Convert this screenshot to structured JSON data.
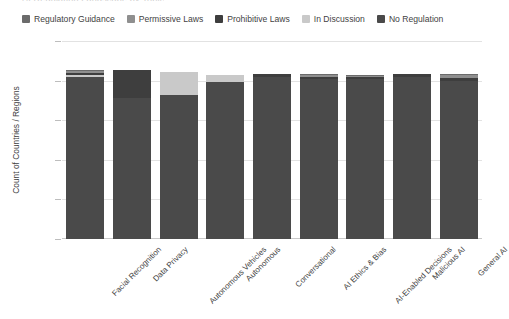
{
  "clipped_title": "AI Regulation Landscape by Topic",
  "legend": {
    "position": "top",
    "items": [
      {
        "label": "Regulatory Guidance",
        "color": "#6b6b6b",
        "icon": "square-swatch"
      },
      {
        "label": "Permissive Laws",
        "color": "#8f8f8f",
        "icon": "square-swatch"
      },
      {
        "label": "Prohibitive Laws",
        "color": "#3e3e3e",
        "icon": "square-swatch"
      },
      {
        "label": "In Discussion",
        "color": "#c9c9c9",
        "icon": "square-swatch"
      },
      {
        "label": "No Regulation",
        "color": "#4a4a4a",
        "icon": "square-swatch"
      }
    ]
  },
  "axes": {
    "ylabel": "Count of Countries / Regions",
    "xlabel": "",
    "yticks": [
      0,
      50,
      100,
      150,
      200,
      250
    ],
    "ylim": [
      0,
      250
    ],
    "grid": true
  },
  "chart_data": {
    "type": "bar",
    "subtype": "stacked-vertical",
    "title": "AI Regulation Landscape by Topic",
    "xlabel": "",
    "ylabel": "Count of Countries / Regions",
    "ylim": [
      0,
      250
    ],
    "yticks": [
      0,
      50,
      100,
      150,
      200,
      250
    ],
    "grid": true,
    "legend_position": "top",
    "categories": [
      "Facial Recognition",
      "Data Privacy",
      "Autonomous Vehicles",
      "Autonomous",
      "Conversational",
      "AI Ethics & Bias",
      "AI-Enabled Decisions",
      "Malicious AI",
      "General AI"
    ],
    "series": [
      {
        "name": "No Regulation",
        "color": "#4a4a4a",
        "values": [
          204,
          178,
          182,
          198,
          205,
          202,
          202,
          205,
          200
        ]
      },
      {
        "name": "In Discussion",
        "color": "#c9c9c9",
        "values": [
          3,
          0,
          29,
          9,
          0,
          0,
          0,
          0,
          0
        ]
      },
      {
        "name": "Prohibitive Laws",
        "color": "#3e3e3e",
        "values": [
          2,
          35,
          0,
          0,
          3,
          3,
          2,
          3,
          3
        ]
      },
      {
        "name": "Permissive Laws",
        "color": "#8f8f8f",
        "values": [
          3,
          0,
          0,
          0,
          0,
          2,
          2,
          0,
          4
        ]
      },
      {
        "name": "Regulatory Guidance",
        "color": "#6b6b6b",
        "values": [
          1,
          0,
          0,
          0,
          0,
          1,
          1,
          0,
          1
        ]
      }
    ],
    "totals": [
      213,
      213,
      211,
      207,
      208,
      208,
      207,
      208,
      208
    ]
  },
  "colors": {
    "background": "#ffffff",
    "grid": "#e2e2e2",
    "axis": "#c8c8c8",
    "text": "#3f3f3f"
  }
}
